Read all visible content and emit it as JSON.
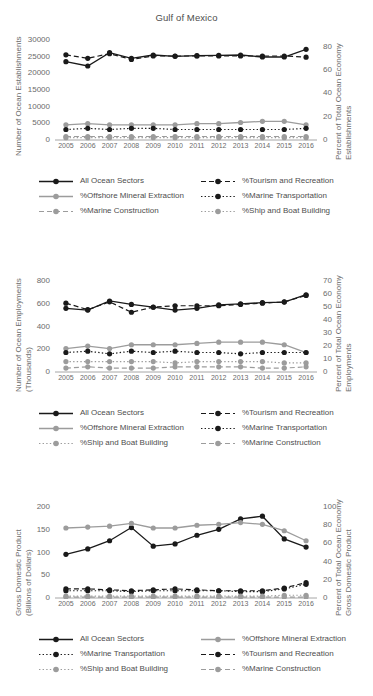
{
  "title": "Gulf of Mexico",
  "series_styles": {
    "all_ocean_sectors": {
      "label": "All Ocean Sectors",
      "color": "#1a1a1a",
      "dash": "solid"
    },
    "offshore_mineral_extraction": {
      "label": "%Offshore Mineral Extraction",
      "color": "#9c9c9c",
      "dash": "solid"
    },
    "marine_construction": {
      "label": "%Marine Construction",
      "color": "#9c9c9c",
      "dash": "dashed"
    },
    "tourism_and_recreation": {
      "label": "%Tourism and Recreation",
      "color": "#1a1a1a",
      "dash": "dashed"
    },
    "marine_transportation": {
      "label": "%Marine Transportation",
      "color": "#1a1a1a",
      "dash": "dotted"
    },
    "ship_and_boat_building": {
      "label": "%Ship and Boat Building",
      "color": "#9c9c9c",
      "dash": "dotted"
    }
  },
  "panels": [
    {
      "id": "establishments",
      "ylabel": "Number of Ocean Establishments",
      "ylabel2": "",
      "y2label": "Percent of Total Ocean Economy",
      "y2label2": "Establishments",
      "legend_order": [
        "all_ocean_sectors",
        "tourism_and_recreation",
        "offshore_mineral_extraction",
        "marine_transportation",
        "marine_construction",
        "ship_and_boat_building"
      ]
    },
    {
      "id": "employments",
      "ylabel": "Number of Ocean Employments",
      "ylabel2": "(Thousands)",
      "y2label": "Percent of Total Ocean Economy",
      "y2label2": "Employments",
      "legend_order": [
        "all_ocean_sectors",
        "tourism_and_recreation",
        "offshore_mineral_extraction",
        "marine_transportation",
        "ship_and_boat_building",
        "marine_construction"
      ]
    },
    {
      "id": "gdp",
      "ylabel": "Gross Domestic Product",
      "ylabel2": "(Billions of Dollars)",
      "y2label": "Percent of Total Ocean Economy",
      "y2label2": "Gross Domestic Product",
      "legend_order": [
        "all_ocean_sectors",
        "offshore_mineral_extraction",
        "marine_transportation",
        "tourism_and_recreation",
        "ship_and_boat_building",
        "marine_construction"
      ]
    }
  ],
  "chart_data": [
    {
      "type": "line",
      "title": "Gulf of Mexico",
      "xlabel": "",
      "ylabel": "Number of Ocean Establishments",
      "y2label": "Percent of Total Ocean Economy Establishments",
      "x": [
        2005,
        2006,
        2007,
        2008,
        2009,
        2010,
        2011,
        2012,
        2013,
        2014,
        2015,
        2016
      ],
      "categories": [
        "2005",
        "2006",
        "2007",
        "2008",
        "2009",
        "2010",
        "2011",
        "2012",
        "2013",
        "2014",
        "2015",
        "2016"
      ],
      "ylim": [
        0,
        30000
      ],
      "yticks": [
        0,
        5000,
        10000,
        15000,
        20000,
        25000,
        30000
      ],
      "y2lim": [
        0,
        85.7
      ],
      "y2ticks": [
        0,
        20,
        40,
        60,
        80
      ],
      "grid": false,
      "legend_position": "below",
      "series": [
        {
          "name": "All Ocean Sectors",
          "axis": "left",
          "color": "#1a1a1a",
          "dash": "solid",
          "values": [
            23500,
            22200,
            26200,
            24500,
            25500,
            25100,
            25300,
            25400,
            25500,
            24900,
            24900,
            27200
          ]
        },
        {
          "name": "%Tourism and Recreation",
          "axis": "right",
          "color": "#1a1a1a",
          "dash": "dashed",
          "values": [
            73,
            70,
            74,
            69,
            72,
            72,
            72,
            72,
            72,
            72,
            72,
            71
          ]
        },
        {
          "name": "%Offshore Mineral Extraction",
          "axis": "right",
          "color": "#9c9c9c",
          "dash": "solid",
          "values": [
            13,
            14,
            13,
            13,
            13,
            13,
            14,
            14,
            15,
            16,
            16,
            13
          ]
        },
        {
          "name": "%Marine Transportation",
          "axis": "right",
          "color": "#1a1a1a",
          "dash": "dotted",
          "values": [
            9,
            10,
            9,
            10,
            10,
            9,
            9,
            9,
            9,
            9,
            9,
            10
          ]
        },
        {
          "name": "%Marine Construction",
          "axis": "right",
          "color": "#9c9c9c",
          "dash": "dashed",
          "values": [
            3,
            3,
            3,
            3,
            3,
            3,
            3,
            3,
            3,
            3,
            3,
            3
          ]
        },
        {
          "name": "%Ship and Boat Building",
          "axis": "right",
          "color": "#9c9c9c",
          "dash": "dotted",
          "values": [
            2,
            2,
            2,
            2,
            2,
            2,
            2,
            2,
            2,
            2,
            2,
            2
          ]
        }
      ]
    },
    {
      "type": "line",
      "title": "",
      "xlabel": "",
      "ylabel": "Number of Ocean Employments (Thousands)",
      "y2label": "Percent of Total Ocean Economy Employments",
      "x": [
        2005,
        2006,
        2007,
        2008,
        2009,
        2010,
        2011,
        2012,
        2013,
        2014,
        2015,
        2016
      ],
      "categories": [
        "2005",
        "2006",
        "2007",
        "2008",
        "2009",
        "2010",
        "2011",
        "2012",
        "2013",
        "2014",
        "2015",
        "2016"
      ],
      "ylim": [
        0,
        880
      ],
      "yticks": [
        0,
        200,
        400,
        600,
        800
      ],
      "y2lim": [
        0,
        77
      ],
      "y2ticks": [
        0,
        10,
        20,
        30,
        40,
        50,
        60,
        70
      ],
      "grid": false,
      "legend_position": "below",
      "series": [
        {
          "name": "All Ocean Sectors",
          "axis": "left",
          "color": "#1a1a1a",
          "dash": "solid",
          "values": [
            560,
            545,
            625,
            595,
            570,
            545,
            560,
            590,
            600,
            610,
            615,
            680
          ]
        },
        {
          "name": "%Tourism and Recreation",
          "axis": "right",
          "color": "#1a1a1a",
          "dash": "dashed",
          "values": [
            53,
            48,
            54,
            46,
            50,
            51,
            51,
            51,
            52,
            53,
            54,
            59
          ]
        },
        {
          "name": "%Offshore Mineral Extraction",
          "axis": "right",
          "color": "#9c9c9c",
          "dash": "solid",
          "values": [
            18,
            20,
            18,
            21,
            21,
            21,
            22,
            23,
            23,
            23,
            21,
            15
          ]
        },
        {
          "name": "%Marine Transportation",
          "axis": "right",
          "color": "#1a1a1a",
          "dash": "dotted",
          "values": [
            15,
            16,
            14,
            16,
            15,
            16,
            15,
            15,
            14,
            15,
            15,
            15
          ]
        },
        {
          "name": "%Ship and Boat Building",
          "axis": "right",
          "color": "#9c9c9c",
          "dash": "dotted",
          "values": [
            8,
            8,
            8,
            8,
            8,
            7,
            8,
            8,
            8,
            8,
            7,
            7
          ]
        },
        {
          "name": "%Marine Construction",
          "axis": "right",
          "color": "#9c9c9c",
          "dash": "dashed",
          "values": [
            3,
            4,
            3,
            3,
            3,
            4,
            4,
            4,
            4,
            3,
            3,
            4
          ]
        }
      ]
    },
    {
      "type": "line",
      "title": "",
      "xlabel": "",
      "ylabel": "Gross Domestic Product (Billions of Dollars)",
      "y2label": "Percent of Total Ocean Economy Gross Domestic Product",
      "x": [
        2005,
        2006,
        2007,
        2008,
        2009,
        2010,
        2011,
        2012,
        2013,
        2014,
        2015,
        2016
      ],
      "categories": [
        "2005",
        "2006",
        "2007",
        "2008",
        "2009",
        "2010",
        "2011",
        "2012",
        "2013",
        "2014",
        "2015",
        "2016"
      ],
      "ylim": [
        0,
        220
      ],
      "yticks": [
        0,
        50,
        100,
        150,
        200
      ],
      "y2lim": [
        0,
        110
      ],
      "y2ticks": [
        0,
        20,
        40,
        60,
        80,
        100
      ],
      "grid": false,
      "legend_position": "below",
      "series": [
        {
          "name": "All Ocean Sectors",
          "axis": "left",
          "color": "#1a1a1a",
          "dash": "solid",
          "values": [
            96,
            108,
            126,
            155,
            114,
            119,
            138,
            151,
            174,
            180,
            130,
            112
          ]
        },
        {
          "name": "%Offshore Mineral Extraction",
          "axis": "right",
          "color": "#9c9c9c",
          "dash": "solid",
          "values": [
            77,
            78,
            79,
            82,
            77,
            77,
            80,
            81,
            83,
            81,
            74,
            63
          ]
        },
        {
          "name": "%Tourism and Recreation",
          "axis": "right",
          "color": "#1a1a1a",
          "dash": "dashed",
          "values": [
            10,
            10,
            9,
            8,
            9,
            10,
            9,
            8,
            8,
            8,
            11,
            17
          ]
        },
        {
          "name": "%Marine Transportation",
          "axis": "right",
          "color": "#1a1a1a",
          "dash": "dotted",
          "values": [
            8,
            8,
            8,
            7,
            8,
            8,
            8,
            8,
            7,
            7,
            10,
            15
          ]
        },
        {
          "name": "%Ship and Boat Building",
          "axis": "right",
          "color": "#9c9c9c",
          "dash": "dotted",
          "values": [
            2,
            2,
            2,
            2,
            2,
            2,
            2,
            2,
            2,
            2,
            3,
            3
          ]
        },
        {
          "name": "%Marine Construction",
          "axis": "right",
          "color": "#9c9c9c",
          "dash": "dashed",
          "values": [
            1,
            1,
            1,
            1,
            1,
            1,
            1,
            1,
            1,
            1,
            1,
            1
          ]
        }
      ]
    }
  ]
}
